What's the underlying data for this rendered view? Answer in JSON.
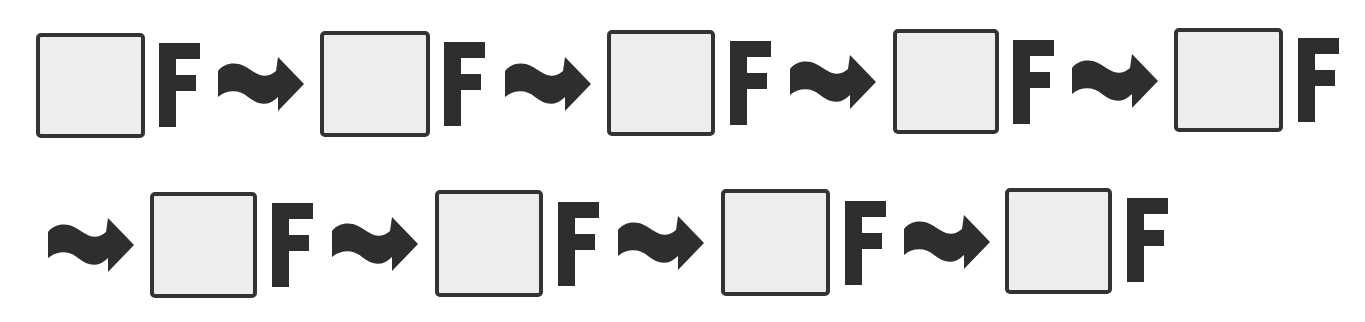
{
  "diagram": {
    "type": "sequence",
    "colors": {
      "background": "#ffffff",
      "ink": "#2e2e2e",
      "box_border": "#333333",
      "box_fill": "#ededed"
    },
    "glyph_letter": "F",
    "connector_icon": "wavy-right-arrow",
    "rows": [
      {
        "items": [
          {
            "kind": "box",
            "index": 1,
            "value": ""
          },
          {
            "kind": "letter",
            "text": "F"
          },
          {
            "kind": "arrow"
          },
          {
            "kind": "box",
            "index": 2,
            "value": ""
          },
          {
            "kind": "letter",
            "text": "F"
          },
          {
            "kind": "arrow"
          },
          {
            "kind": "box",
            "index": 3,
            "value": ""
          },
          {
            "kind": "letter",
            "text": "F"
          },
          {
            "kind": "arrow"
          },
          {
            "kind": "box",
            "index": 4,
            "value": ""
          },
          {
            "kind": "letter",
            "text": "F"
          },
          {
            "kind": "arrow"
          },
          {
            "kind": "box",
            "index": 5,
            "value": ""
          },
          {
            "kind": "letter",
            "text": "F"
          }
        ]
      },
      {
        "items": [
          {
            "kind": "arrow"
          },
          {
            "kind": "box",
            "index": 6,
            "value": ""
          },
          {
            "kind": "letter",
            "text": "F"
          },
          {
            "kind": "arrow"
          },
          {
            "kind": "box",
            "index": 7,
            "value": ""
          },
          {
            "kind": "letter",
            "text": "F"
          },
          {
            "kind": "arrow"
          },
          {
            "kind": "box",
            "index": 8,
            "value": ""
          },
          {
            "kind": "letter",
            "text": "F"
          },
          {
            "kind": "arrow"
          },
          {
            "kind": "box",
            "index": 9,
            "value": ""
          },
          {
            "kind": "letter",
            "text": "F"
          }
        ]
      }
    ],
    "box_count": 9,
    "arrow_count": 8
  }
}
